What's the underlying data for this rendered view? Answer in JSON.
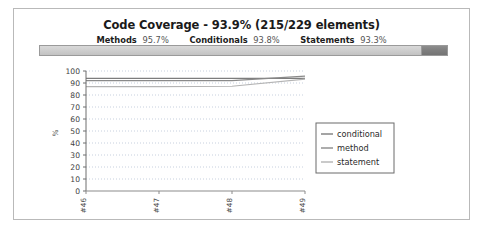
{
  "report": {
    "title": "Code Coverage - 93.9% (215/229 elements)",
    "stats": [
      {
        "label": "Methods",
        "value": "95.7%"
      },
      {
        "label": "Conditionals",
        "value": "93.8%"
      },
      {
        "label": "Statements",
        "value": "93.3%"
      }
    ],
    "coverage_bar": {
      "covered_percent": 93.9,
      "covered_color": "#cfcfcf",
      "uncovered_color": "#7e7e7e"
    }
  },
  "chart_data": {
    "type": "line",
    "title": "",
    "xlabel": "",
    "ylabel": "%",
    "ylim": [
      0,
      100
    ],
    "ytick_step": 10,
    "yticks": [
      "100",
      "90",
      "80",
      "70",
      "60",
      "50",
      "40",
      "30",
      "20",
      "10",
      "0"
    ],
    "categories": [
      "#46",
      "#47",
      "#48",
      "#49"
    ],
    "grid": "horizontal-dotted",
    "legend_position": "center-right",
    "series": [
      {
        "name": "conditional",
        "values": [
          93.8,
          93.8,
          93.8,
          93.8
        ],
        "color": "#7d7d7d"
      },
      {
        "name": "method",
        "values": [
          92.0,
          92.0,
          92.0,
          95.7
        ],
        "color": "#8a8a8a"
      },
      {
        "name": "statement",
        "values": [
          87.0,
          87.0,
          87.3,
          93.3
        ],
        "color": "#b4b4b4"
      }
    ]
  }
}
